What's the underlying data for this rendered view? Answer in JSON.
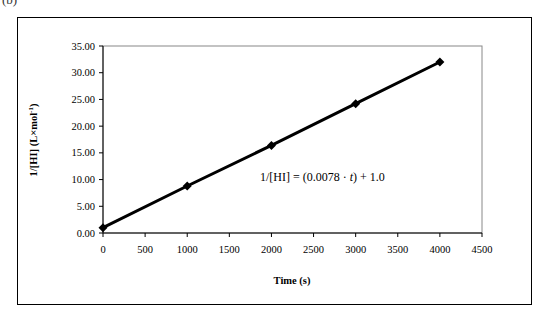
{
  "panel_label": "(b)",
  "chart_data": {
    "type": "line",
    "title": "",
    "xlabel": "Time (s)",
    "ylabel": "1/[HI] (L×mol⁻¹)",
    "xlim": [
      0,
      4500
    ],
    "ylim": [
      0,
      35
    ],
    "x_ticks": [
      "0",
      "500",
      "1000",
      "1500",
      "2000",
      "2500",
      "3000",
      "3500",
      "4000",
      "4500"
    ],
    "y_ticks": [
      "0.00",
      "5.00",
      "10.00",
      "15.00",
      "20.00",
      "25.00",
      "30.00",
      "35.00"
    ],
    "grid": false,
    "legend": null,
    "marker": "diamond",
    "series": [
      {
        "name": "1/[HI]",
        "x": [
          0,
          1000,
          2000,
          3000,
          4000
        ],
        "values": [
          1.0,
          8.8,
          16.4,
          24.2,
          32.0
        ]
      }
    ],
    "annotations": [
      {
        "text": "1/[HI] = (0.0078 · t) + 1.0",
        "x": 2500,
        "y": 11
      }
    ]
  }
}
